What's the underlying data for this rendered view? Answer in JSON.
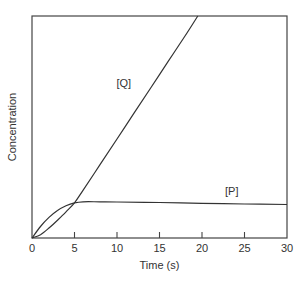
{
  "chart_data": {
    "type": "line",
    "title": "",
    "xlabel": "Time (s)",
    "ylabel": "Concentration",
    "xlim": [
      0,
      30
    ],
    "ylim": [
      0,
      100
    ],
    "xticks": [
      0,
      5,
      10,
      15,
      20,
      25,
      30
    ],
    "xtick_labels": [
      "0",
      "5",
      "10",
      "15",
      "20",
      "25",
      "30"
    ],
    "yticks": [],
    "grid": false,
    "legend": "inline labels",
    "series": [
      {
        "name": "[Q]",
        "label": "[Q]",
        "x": [
          0,
          1,
          2,
          3,
          4,
          5,
          6,
          8,
          10,
          12,
          14,
          16,
          18,
          19.5
        ],
        "y": [
          0,
          1.5,
          4.5,
          8,
          11.8,
          15.8,
          21.5,
          33,
          44.6,
          56.2,
          67.8,
          79.4,
          91,
          100
        ]
      },
      {
        "name": "[P]",
        "label": "[P]",
        "x": [
          0,
          1,
          2,
          3,
          4,
          5,
          6,
          8,
          10,
          15,
          20,
          25,
          30
        ],
        "y": [
          0,
          5.2,
          9.3,
          12.4,
          14.5,
          15.8,
          16.3,
          16.3,
          16.2,
          16.0,
          15.6,
          15.3,
          15.1
        ]
      }
    ],
    "annotations": [
      {
        "text": "[Q]",
        "x": 10.8,
        "y": 68
      },
      {
        "text": "[P]",
        "x": 23.5,
        "y": 19.5
      }
    ]
  }
}
